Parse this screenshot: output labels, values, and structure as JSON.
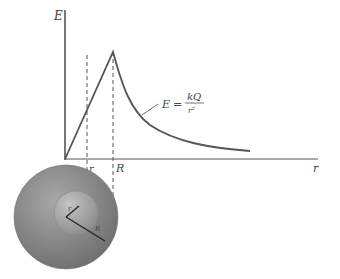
{
  "figure": {
    "type": "field-vs-radius-diagram",
    "y_axis_label": "E",
    "x_axis_label": "r",
    "tick_labels": {
      "inner": "r",
      "outer": "R"
    },
    "formula": {
      "lhs": "E",
      "eq": "=",
      "numerator": "kQ",
      "denominator": "r²"
    },
    "sphere_labels": {
      "inner_radius": "r",
      "outer_radius": "R"
    },
    "colors": {
      "line": "#555555",
      "sphere_outer": "#8a8a8a",
      "sphere_inner": "#a0a0a0"
    }
  }
}
